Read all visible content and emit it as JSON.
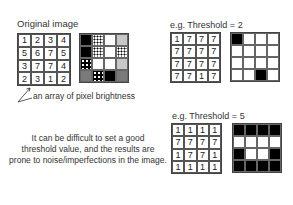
{
  "original": {
    "title": "Original image",
    "values": [
      [
        1,
        2,
        3,
        4
      ],
      [
        5,
        6,
        7,
        5
      ],
      [
        3,
        7,
        7,
        4
      ],
      [
        2,
        3,
        1,
        2
      ]
    ],
    "pixels": [
      [
        "black",
        "dots",
        "white",
        "light"
      ],
      [
        "black",
        "dots",
        "white",
        "dots"
      ],
      [
        "sparse",
        "white",
        "white",
        "light"
      ],
      [
        "dark",
        "sparse",
        "black",
        "dark"
      ]
    ],
    "annotation": "an array of pixel brightness"
  },
  "threshold2": {
    "title": "e.g. Threshold = 2",
    "values": [
      [
        1,
        7,
        7,
        7
      ],
      [
        7,
        7,
        7,
        7
      ],
      [
        7,
        7,
        7,
        7
      ],
      [
        7,
        7,
        1,
        7
      ]
    ],
    "binary": [
      [
        1,
        0,
        0,
        0
      ],
      [
        0,
        0,
        0,
        0
      ],
      [
        0,
        0,
        0,
        0
      ],
      [
        0,
        0,
        1,
        0
      ]
    ]
  },
  "threshold5": {
    "title": "e.g. Threshold = 5",
    "values": [
      [
        1,
        1,
        1,
        1
      ],
      [
        7,
        7,
        7,
        7
      ],
      [
        1,
        7,
        7,
        1
      ],
      [
        1,
        1,
        1,
        1
      ]
    ],
    "binary": [
      [
        1,
        1,
        1,
        1
      ],
      [
        0,
        0,
        0,
        0
      ],
      [
        1,
        0,
        0,
        1
      ],
      [
        1,
        1,
        1,
        1
      ]
    ]
  },
  "note": {
    "line1": "It can be difficult to set a good",
    "line2": "threshold value, and the results are",
    "line3": "prone to noise/imperfections in the image."
  }
}
